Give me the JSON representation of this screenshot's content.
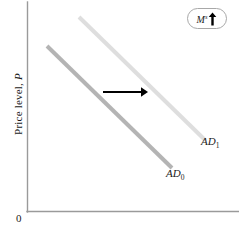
{
  "figure": {
    "name": "aggregate-demand-shift-diagram",
    "background_color": "#ffffff"
  },
  "axes": {
    "y_label_prefix": "Price level, ",
    "y_label_variable": "P",
    "origin_label": "0",
    "axis_color": "#9a9a9a"
  },
  "curves": [
    {
      "id": "ad0",
      "label_text": "AD",
      "label_subscript": "0",
      "color": "#b4b4b4",
      "x1": 47,
      "y1": 46,
      "x2": 172,
      "y2": 168
    },
    {
      "id": "ad1",
      "label_text": "AD",
      "label_subscript": "1",
      "color": "#dedede",
      "x1": 79,
      "y1": 17,
      "x2": 205,
      "y2": 140
    }
  ],
  "shift_arrow": {
    "name": "rightward-shift-arrow",
    "color": "#000000",
    "x_start": 103,
    "x_end": 148,
    "y": 92
  },
  "shock_badge": {
    "variable": "M",
    "superscript": "s",
    "direction_icon": "up-arrow-icon",
    "border_color": "#a8a8a8"
  },
  "chart_data": {
    "type": "line",
    "title": "",
    "xlabel": "",
    "ylabel": "Price level, P",
    "grid": false,
    "legend": "inline-curve-labels",
    "annotations": [
      "M^s up",
      "rightward shift arrow"
    ],
    "series": [
      {
        "name": "AD0",
        "points": [
          [
            47,
            46
          ],
          [
            172,
            168
          ]
        ],
        "color": "#b4b4b4"
      },
      {
        "name": "AD1",
        "points": [
          [
            79,
            17
          ],
          [
            205,
            140
          ]
        ],
        "color": "#dedede"
      }
    ]
  }
}
